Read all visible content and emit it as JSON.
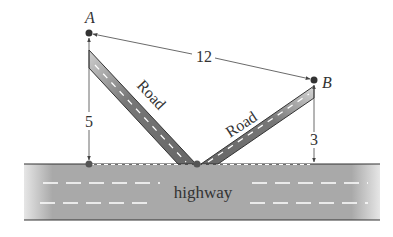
{
  "diagram": {
    "points": {
      "A": {
        "label": "A"
      },
      "B": {
        "label": "B"
      }
    },
    "dimensions": {
      "AB": "12",
      "A_height": "5",
      "B_height": "3"
    },
    "roads": {
      "left": "Road",
      "right": "Road"
    },
    "highway_label": "highway"
  }
}
